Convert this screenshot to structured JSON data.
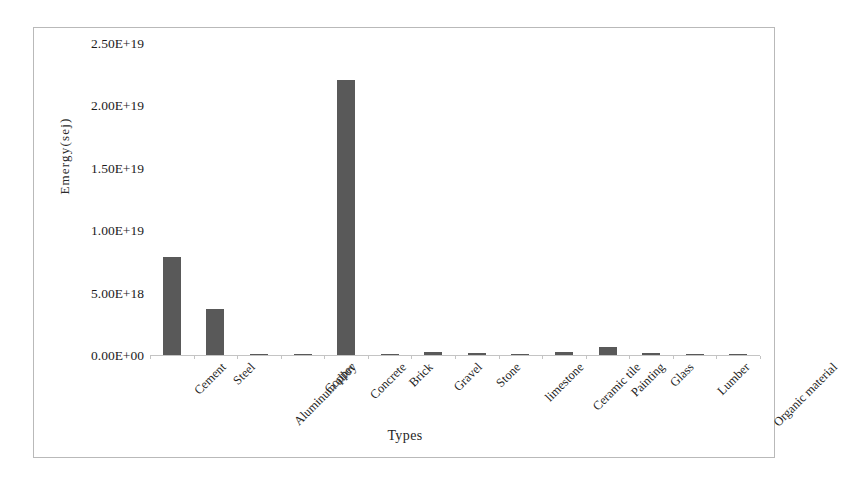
{
  "chart_data": {
    "type": "bar",
    "title": "",
    "xlabel": "Types",
    "ylabel": "Emergy(sej)",
    "categories": [
      "Cement",
      "Steel",
      "Aluminum alloy",
      "Copper",
      "Concrete",
      "Brick",
      "Gravel",
      "Stone",
      "limestone",
      "Ceramic tile",
      "Painting",
      "Glass",
      "Lumber",
      "Organic material"
    ],
    "values": [
      7.85e+18,
      3.7e+18,
      1e+17,
      1e+17,
      2.2e+19,
      8e+16,
      2.4e+17,
      1.7e+17,
      1e+17,
      2.7e+17,
      6.3e+17,
      1.9e+17,
      8e+16,
      1.2e+17
    ],
    "ylim": [
      0,
      2.5e+19
    ],
    "ytick_values": [
      0,
      5e+18,
      1e+19,
      1.5e+19,
      2e+19,
      2.5e+19
    ],
    "ytick_labels": [
      "0.00E+00",
      "5.00E+18",
      "1.00E+19",
      "1.50E+19",
      "2.00E+19",
      "2.50E+19"
    ],
    "grid": false,
    "legend": false,
    "bar_color": "#595959",
    "axis_color": "#c4c4c4",
    "border_color": "#b9b9b9",
    "xtick_label_rotation": -45
  }
}
